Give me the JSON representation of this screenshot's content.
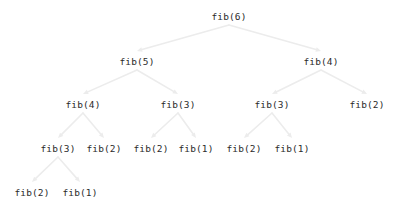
{
  "diagram": {
    "type": "tree",
    "background_color": "#ffffff",
    "node_text_color": "#2b2b2b",
    "edge_color": "#ececec",
    "edge_arrowhead": "triangle",
    "nodes": [
      {
        "id": "n0",
        "label": "fib(6)",
        "x": 229,
        "y": 16,
        "level": 0
      },
      {
        "id": "n1",
        "label": "fib(5)",
        "x": 137,
        "y": 61,
        "level": 1
      },
      {
        "id": "n2",
        "label": "fib(4)",
        "x": 321,
        "y": 61,
        "level": 1
      },
      {
        "id": "n3",
        "label": "fib(4)",
        "x": 83,
        "y": 104,
        "level": 2
      },
      {
        "id": "n4",
        "label": "fib(3)",
        "x": 178,
        "y": 104,
        "level": 2
      },
      {
        "id": "n5",
        "label": "fib(3)",
        "x": 272,
        "y": 104,
        "level": 2
      },
      {
        "id": "n6",
        "label": "fib(2)",
        "x": 367,
        "y": 104,
        "level": 2
      },
      {
        "id": "n7",
        "label": "fib(3)",
        "x": 58,
        "y": 148,
        "level": 3
      },
      {
        "id": "n8",
        "label": "fib(2)",
        "x": 104,
        "y": 148,
        "level": 3
      },
      {
        "id": "n9",
        "label": "fib(2)",
        "x": 151,
        "y": 148,
        "level": 3
      },
      {
        "id": "n10",
        "label": "fib(1)",
        "x": 196,
        "y": 148,
        "level": 3
      },
      {
        "id": "n11",
        "label": "fib(2)",
        "x": 244,
        "y": 148,
        "level": 3
      },
      {
        "id": "n12",
        "label": "fib(1)",
        "x": 292,
        "y": 148,
        "level": 3
      },
      {
        "id": "n13",
        "label": "fib(2)",
        "x": 32,
        "y": 192,
        "level": 4
      },
      {
        "id": "n14",
        "label": "fib(1)",
        "x": 80,
        "y": 192,
        "level": 4
      }
    ],
    "edges": [
      {
        "from": "n0",
        "to": "n1"
      },
      {
        "from": "n0",
        "to": "n2"
      },
      {
        "from": "n1",
        "to": "n3"
      },
      {
        "from": "n1",
        "to": "n4"
      },
      {
        "from": "n2",
        "to": "n5"
      },
      {
        "from": "n2",
        "to": "n6"
      },
      {
        "from": "n3",
        "to": "n7"
      },
      {
        "from": "n3",
        "to": "n8"
      },
      {
        "from": "n4",
        "to": "n9"
      },
      {
        "from": "n4",
        "to": "n10"
      },
      {
        "from": "n5",
        "to": "n11"
      },
      {
        "from": "n5",
        "to": "n12"
      },
      {
        "from": "n7",
        "to": "n13"
      },
      {
        "from": "n7",
        "to": "n14"
      }
    ]
  }
}
